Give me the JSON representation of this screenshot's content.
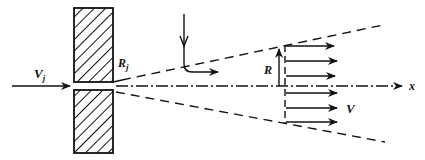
{
  "figure": {
    "labels": {
      "jet_velocity": "V",
      "jet_velocity_sub": "j",
      "jet_radius": "R",
      "jet_radius_sub": "j",
      "radius": "R",
      "velocity": "V",
      "axis": "x"
    },
    "colors": {
      "ink": "#111111",
      "background": "#ffffff"
    },
    "profile_arrow_count": 6
  }
}
